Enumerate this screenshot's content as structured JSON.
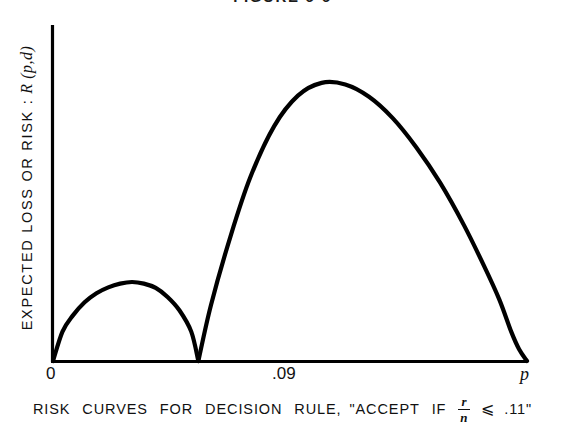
{
  "figure": {
    "title": "FIGURE 6-6",
    "caption_parts": {
      "words": [
        "RISK",
        "CURVES",
        "FOR",
        "DECISION",
        "RULE,"
      ],
      "quote_open": "\"ACCEPT",
      "if_word": "IF",
      "fraction_numerator": "r",
      "fraction_denominator": "n",
      "relation": "⩽",
      "threshold": ".11",
      "quote_close": "\""
    },
    "caption_full": "RISK CURVES FOR DECISION RULE, \"ACCEPT IF r/n ⩽ .11\""
  },
  "axes": {
    "ylabel_text": "EXPECTED LOSS OR RISK :",
    "ylabel_symbol": "R (p,d)",
    "xticks": [
      {
        "name": "origin",
        "label": "0"
      },
      {
        "name": "breakpoint",
        "label": ".09"
      },
      {
        "name": "axis-variable",
        "label": "p"
      }
    ]
  },
  "colors": {
    "background": "#ffffff",
    "ink": "#000000",
    "curve": "#000000"
  },
  "chart_data": {
    "type": "line",
    "title": "FIGURE 6-6",
    "subtitle": "RISK CURVES FOR DECISION RULE, \"ACCEPT IF r/n ⩽ .11\"",
    "xlabel": "p",
    "ylabel": "EXPECTED LOSS OR RISK : R (p,d)",
    "xlim": [
      0,
      1
    ],
    "ylim": [
      0,
      1
    ],
    "grid": false,
    "legend": null,
    "axis_ticks_x": [
      "0",
      ".09",
      "p"
    ],
    "axis_ticks_y": [],
    "annotations": [
      "Two risk lobes meet the horizontal axis at p = .09",
      "Left lobe is low and broad; right lobe is tall with peak near p = .35"
    ],
    "series": [
      {
        "name": "risk-lobe-left",
        "comment": "Risk for p below the break point .09; zero at p=0 and p=.09",
        "x": [
          0.0,
          0.012,
          0.025,
          0.04,
          0.055,
          0.07,
          0.085,
          0.1,
          0.115,
          0.13,
          0.145,
          0.16,
          0.175,
          0.184
        ],
        "y": [
          0.0,
          0.055,
          0.085,
          0.11,
          0.127,
          0.138,
          0.145,
          0.148,
          0.145,
          0.137,
          0.12,
          0.095,
          0.055,
          0.0
        ]
      },
      {
        "name": "risk-lobe-right",
        "comment": "Risk for p above the break point .09; zero at p=.09 and at p = right axis end",
        "x": [
          0.184,
          0.2,
          0.225,
          0.25,
          0.28,
          0.31,
          0.34,
          0.37,
          0.4,
          0.43,
          0.46,
          0.49,
          0.52,
          0.545,
          0.565,
          0.58,
          0.59,
          0.6
        ],
        "y": [
          0.0,
          0.105,
          0.235,
          0.345,
          0.44,
          0.497,
          0.521,
          0.518,
          0.495,
          0.455,
          0.4,
          0.334,
          0.255,
          0.18,
          0.115,
          0.055,
          0.022,
          0.0
        ]
      }
    ]
  }
}
